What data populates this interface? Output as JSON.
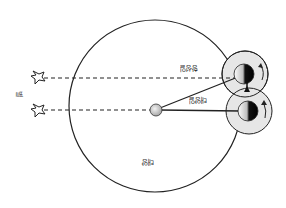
{
  "diagram": {
    "type": "sidereal-vs-solar-day",
    "labels": {
      "star": "별",
      "sidereal_day": "항성일",
      "solar_day": "태양일",
      "sun": "태양"
    },
    "colors": {
      "line": "#222222",
      "earth_halo": "#e4e4e4",
      "sun_fill": "#cfcfcf",
      "background": "#ffffff"
    }
  }
}
